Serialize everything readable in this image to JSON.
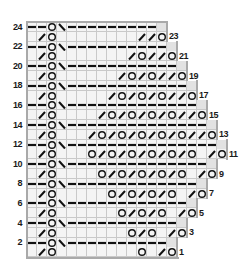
{
  "chart_title": "Knitting lace edging chart",
  "colors": {
    "cell_bg": "#f4f4f4",
    "grid_line": "#c9c9c9",
    "outline": "#a9a9a9",
    "trailing_cell": "#e2e2e2",
    "symbol": "#111111"
  },
  "legend_symbols": {
    "-": "purl (dash)",
    "O": "yarn over (circle)",
    "/": "k2tog (right-leaning slash)",
    "\\": "ssk (left-leaning slash)",
    "_": "knit (empty cell)",
    "#": "no-stitch trailing cell"
  },
  "rows": [
    {
      "num": 24,
      "label": "24",
      "side": "left",
      "cells": "--O\\---------#"
    },
    {
      "num": 23,
      "label": "23",
      "side": "right",
      "cells": "_/O________//O"
    },
    {
      "num": 22,
      "label": "22",
      "side": "left",
      "cells": "--O\\----------#"
    },
    {
      "num": 21,
      "label": "21",
      "side": "right",
      "cells": "_/O_______/O//O"
    },
    {
      "num": 20,
      "label": "20",
      "side": "left",
      "cells": "--O\\-----------#"
    },
    {
      "num": 19,
      "label": "19",
      "side": "right",
      "cells": "_/O______/O/O//O"
    },
    {
      "num": 18,
      "label": "18",
      "side": "left",
      "cells": "--O\\------------#"
    },
    {
      "num": 17,
      "label": "17",
      "side": "right",
      "cells": "_/O_____/O/O/O//O"
    },
    {
      "num": 16,
      "label": "16",
      "side": "left",
      "cells": "--O\\-------------#"
    },
    {
      "num": 15,
      "label": "15",
      "side": "right",
      "cells": "_/O____/O/O/O/O//O"
    },
    {
      "num": 14,
      "label": "14",
      "side": "left",
      "cells": "--O\\--------------#"
    },
    {
      "num": 13,
      "label": "13",
      "side": "right",
      "cells": "_/O___/O/O/O/O/O//O"
    },
    {
      "num": 12,
      "label": "12",
      "side": "left",
      "cells": "--O\\---------------#"
    },
    {
      "num": 11,
      "label": "11",
      "side": "right",
      "cells": "_/O___O/O/O/O/O/O_/O"
    },
    {
      "num": 10,
      "label": "10",
      "side": "left",
      "cells": "--O\\--------------#"
    },
    {
      "num": 9,
      "label": "9",
      "side": "right",
      "cells": "_/O____O/O/O/O/O_/O"
    },
    {
      "num": 8,
      "label": "8",
      "side": "left",
      "cells": "--O\\-------------#"
    },
    {
      "num": 7,
      "label": "7",
      "side": "right",
      "cells": "_/O_____O/O/O/O_/O"
    },
    {
      "num": 6,
      "label": "6",
      "side": "left",
      "cells": "--O\\------------#"
    },
    {
      "num": 5,
      "label": "5",
      "side": "right",
      "cells": "_/O______O/O/O_/O"
    },
    {
      "num": 4,
      "label": "4",
      "side": "left",
      "cells": "--O\\-----------#"
    },
    {
      "num": 3,
      "label": "3",
      "side": "right",
      "cells": "_/O_______O/O_/O"
    },
    {
      "num": 2,
      "label": "2",
      "side": "left",
      "cells": "--O\\----------#"
    },
    {
      "num": 1,
      "label": "1",
      "side": "right",
      "cells": "_/O________O_/O"
    }
  ]
}
